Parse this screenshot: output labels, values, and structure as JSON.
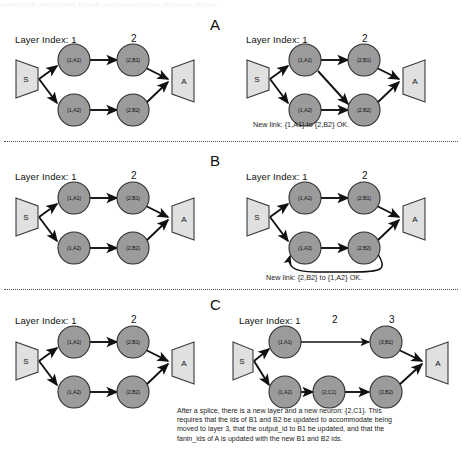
{
  "page": {
    "bleed_text": "mmmmm mmmmm mmm mmmmmmmm mmmm mmm"
  },
  "sections": [
    {
      "id": "A",
      "letter": "A",
      "left_panel": {
        "layer_index_label": "Layer Index: 1",
        "layer2_label": "2",
        "source_label": "S",
        "sink_label": "A",
        "nodes": [
          {
            "id": "n1",
            "label": "{1,A1}"
          },
          {
            "id": "n2",
            "label": "{1,A2}"
          },
          {
            "id": "n3",
            "label": "{2,B1}"
          },
          {
            "id": "n4",
            "label": "{2,B2}"
          }
        ]
      },
      "right_panel": {
        "layer_index_label": "Layer Index: 1",
        "layer2_label": "2",
        "source_label": "S",
        "sink_label": "A",
        "nodes": [
          {
            "id": "n1",
            "label": "{1,A1}"
          },
          {
            "id": "n2",
            "label": "{1,A2}"
          },
          {
            "id": "n3",
            "label": "{2,B1}"
          },
          {
            "id": "n4",
            "label": "{2,B2}"
          }
        ],
        "caption": "New link: {1,A1} to {2,B2} OK."
      }
    },
    {
      "id": "B",
      "letter": "B",
      "left_panel": {
        "layer_index_label": "Layer Index: 1",
        "layer2_label": "2",
        "source_label": "S",
        "sink_label": "A",
        "nodes": [
          {
            "id": "n1",
            "label": "{1,A1}"
          },
          {
            "id": "n2",
            "label": "{1,A2}"
          },
          {
            "id": "n3",
            "label": "{2,B1}"
          },
          {
            "id": "n4",
            "label": "{2,B2}"
          }
        ]
      },
      "right_panel": {
        "layer_index_label": "Layer Index: 1",
        "layer2_label": "2",
        "source_label": "S",
        "sink_label": "A",
        "nodes": [
          {
            "id": "n1",
            "label": "{1,A1}"
          },
          {
            "id": "n2",
            "label": "{1,A2}"
          },
          {
            "id": "n3",
            "label": "{2,B1}"
          },
          {
            "id": "n4",
            "label": "{2,B2}"
          }
        ],
        "caption": "New link: {2,B2} to {1,A2} OK."
      }
    },
    {
      "id": "C",
      "letter": "C",
      "left_panel": {
        "layer_index_label": "Layer Index: 1",
        "layer2_label": "2",
        "source_label": "S",
        "sink_label": "A",
        "nodes": [
          {
            "id": "n1",
            "label": "{1,A1}"
          },
          {
            "id": "n2",
            "label": "{1,A2}"
          },
          {
            "id": "n3",
            "label": "{2,B1}"
          },
          {
            "id": "n4",
            "label": "{2,B2}"
          }
        ]
      },
      "right_panel": {
        "layer_index_label": "Layer Index: 1",
        "layer2_label": "2",
        "layer3_label": "3",
        "source_label": "S",
        "sink_label": "A",
        "nodes": [
          {
            "id": "n1",
            "label": "{1,A1}"
          },
          {
            "id": "n2",
            "label": "{1,A2}"
          },
          {
            "id": "n5",
            "label": "{2,C1}"
          },
          {
            "id": "n3",
            "label": "{3,B1}"
          },
          {
            "id": "n4",
            "label": "{3,B2}"
          }
        ],
        "caption_lines": [
          "After a splice, there is a new layer and a new neuron: {2,C1}. This",
          "requires that the ids of B1 and B2 be updated to accommodate being",
          "moved to layer 3, that the output_id to B1 be updated, and that the",
          "fanin_ids of A is updated with the new B1 and B2 ids."
        ]
      }
    }
  ],
  "colors": {
    "node_fill": "#9b9b9b",
    "node_stroke": "#2e2e2e",
    "trapezoid_fill": "#e0e0e0",
    "trapezoid_stroke": "#3a3a3a",
    "edge": "#111111",
    "divider": "#4a4a4a",
    "background": "#ffffff"
  }
}
